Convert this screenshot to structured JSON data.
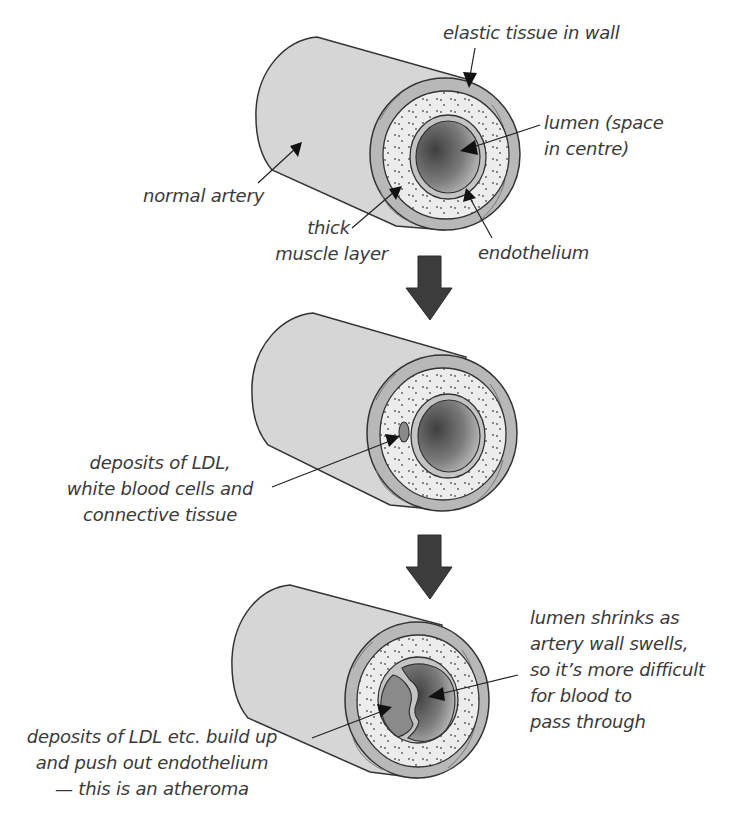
{
  "diagram": {
    "title_fragment": "",
    "colors": {
      "background": "#ffffff",
      "artery_body": "#d6d6d6",
      "elastic_wall": "#b8b8b8",
      "muscle_layer": "#ececec",
      "endothelium": "#c4c4c4",
      "lumen_dark": "#4a4a4a",
      "lumen_light": "#bdbdbd",
      "arrow": "#3c3c3c",
      "text": "#3a3a3a"
    },
    "stages": [
      {
        "name": "normal artery",
        "labels": {
          "elastic_tissue": "elastic tissue in wall",
          "lumen_line1": "lumen (space",
          "lumen_line2": "in centre)",
          "normal_artery": "normal artery",
          "muscle_line1": "thick",
          "muscle_line2": "muscle layer",
          "endothelium": "endothelium"
        }
      },
      {
        "name": "early deposits",
        "labels": {
          "deposits_line1": "deposits of LDL,",
          "deposits_line2": "white blood cells and",
          "deposits_line3": "connective tissue"
        }
      },
      {
        "name": "atheroma",
        "labels": {
          "lumen_line1": "lumen shrinks as",
          "lumen_line2": "artery wall swells,",
          "lumen_line3": "so it’s more difficult",
          "lumen_line4": "for blood to",
          "lumen_line5": "pass through",
          "atheroma_line1": "deposits of LDL etc. build up",
          "atheroma_line2": "and push out endothelium",
          "atheroma_line3": "— this is an atheroma"
        }
      }
    ],
    "transition_arrows": [
      "down-arrow",
      "down-arrow"
    ]
  }
}
